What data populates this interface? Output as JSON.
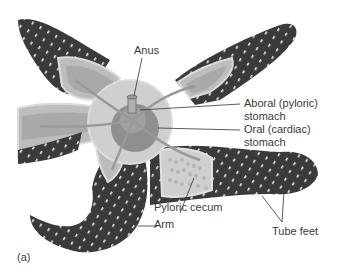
{
  "figure": {
    "panel_label": "(a)",
    "colors": {
      "skin": "#3a3a3a",
      "skin_spot": "#e8e8e8",
      "cut_surface": "#bdbdbd",
      "gland_light": "#cfcfcf",
      "gland_mid": "#a9a9a9",
      "stomach": "#8f8f8f",
      "leader_line": "#333333",
      "text": "#3a3a3a",
      "background": "#ffffff"
    },
    "labels": {
      "anus": "Anus",
      "aboral_stomach_1": "Aboral (pyloric)",
      "aboral_stomach_2": "stomach",
      "oral_stomach_1": "Oral (cardiac)",
      "oral_stomach_2": "stomach",
      "pyloric_cecum": "Pyloric cecum",
      "arm": "Arm",
      "tube_feet": "Tube feet"
    }
  }
}
